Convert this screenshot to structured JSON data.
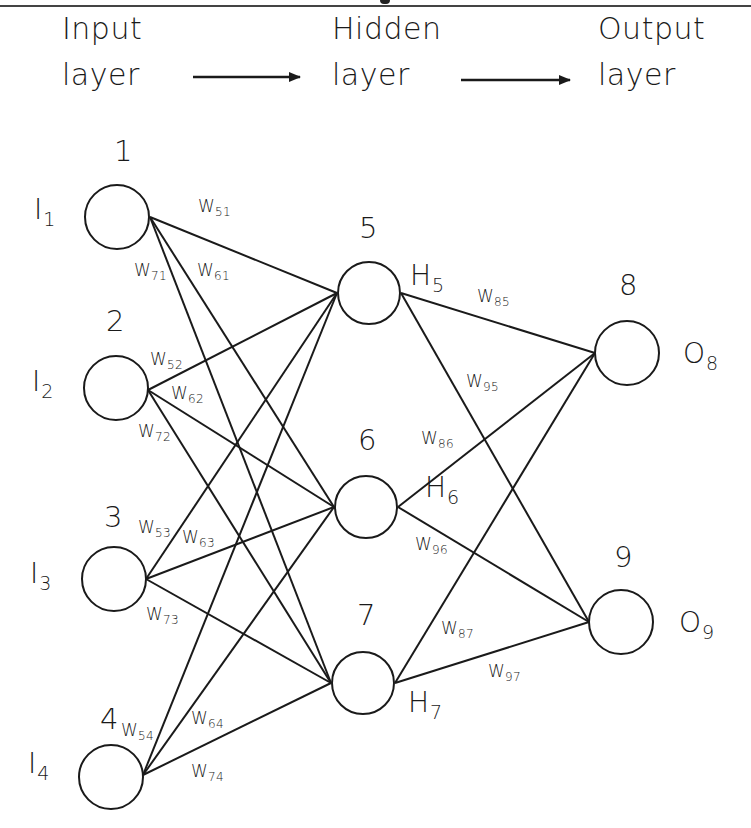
{
  "header": {
    "input_layer": [
      "Input",
      "layer"
    ],
    "hidden_layer": [
      "Hidden",
      "layer"
    ],
    "output_layer": [
      "Output",
      "layer"
    ]
  },
  "nodes": {
    "input": [
      {
        "id": "1",
        "symbol": "I",
        "sub": "1"
      },
      {
        "id": "2",
        "symbol": "I",
        "sub": "2"
      },
      {
        "id": "3",
        "symbol": "I",
        "sub": "3"
      },
      {
        "id": "4",
        "symbol": "I",
        "sub": "4"
      }
    ],
    "hidden": [
      {
        "id": "5",
        "symbol": "H",
        "sub": "5"
      },
      {
        "id": "6",
        "symbol": "H",
        "sub": "6"
      },
      {
        "id": "7",
        "symbol": "H",
        "sub": "7"
      }
    ],
    "output": [
      {
        "id": "8",
        "symbol": "O",
        "sub": "8"
      },
      {
        "id": "9",
        "symbol": "O",
        "sub": "9"
      }
    ]
  },
  "weights": {
    "w51": {
      "w": "W",
      "sub": "51"
    },
    "w61": {
      "w": "W",
      "sub": "61"
    },
    "w71": {
      "w": "W",
      "sub": "71"
    },
    "w52": {
      "w": "W",
      "sub": "52"
    },
    "w62": {
      "w": "W",
      "sub": "62"
    },
    "w72": {
      "w": "W",
      "sub": "72"
    },
    "w53": {
      "w": "W",
      "sub": "53"
    },
    "w63": {
      "w": "W",
      "sub": "63"
    },
    "w73": {
      "w": "W",
      "sub": "73"
    },
    "w54": {
      "w": "W",
      "sub": "54"
    },
    "w64": {
      "w": "W",
      "sub": "64"
    },
    "w74": {
      "w": "W",
      "sub": "74"
    },
    "w85": {
      "w": "W",
      "sub": "85"
    },
    "w95": {
      "w": "W",
      "sub": "95"
    },
    "w86": {
      "w": "W",
      "sub": "86"
    },
    "w96": {
      "w": "W",
      "sub": "96"
    },
    "w87": {
      "w": "W",
      "sub": "87"
    },
    "w97": {
      "w": "W",
      "sub": "97"
    }
  },
  "colors": {
    "stroke": "#1a1a1a",
    "background": "#ffffff"
  }
}
